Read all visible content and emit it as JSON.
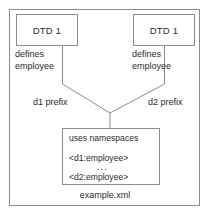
{
  "diagram": {
    "type": "namespace-dtd-diagram",
    "outer_container": {
      "caption": "example.xml"
    },
    "dtd_boxes": [
      {
        "id": "left",
        "label": "DTD 1",
        "caption_line1": "defines",
        "caption_line2": "employee",
        "prefix_label": "d1 prefix"
      },
      {
        "id": "right",
        "label": "DTD 1",
        "caption_line1": "defines",
        "caption_line2": "employee",
        "prefix_label": "d2 prefix"
      }
    ],
    "inner_box": {
      "heading": "uses namespaces",
      "tag_one": "<d1:employee>",
      "ellipsis": "...",
      "tag_two": "<d2:employee>"
    },
    "colors": {
      "stroke": "#8c8c8c",
      "text": "#2b2b2b",
      "background": "#ffffff"
    }
  }
}
